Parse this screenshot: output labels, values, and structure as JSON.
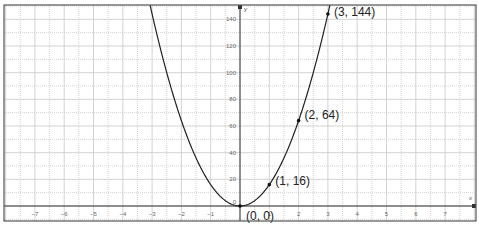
{
  "chart_data": {
    "type": "line",
    "title": "",
    "function": "y = 16x^2",
    "xlabel": "x",
    "ylabel": "y",
    "xlim": [
      -8.2,
      8.1
    ],
    "ylim": [
      -11,
      150
    ],
    "grid": true,
    "x_ticks": [
      -7,
      -6,
      -5,
      -4,
      -3,
      -2,
      -1,
      1,
      2,
      3,
      4,
      5,
      6,
      7
    ],
    "x_tick_labels": [
      "−7",
      "−6",
      "−5",
      "−4",
      "−3",
      "−2",
      "−1",
      "1",
      "2",
      "3",
      "4",
      "5",
      "6",
      "7"
    ],
    "y_ticks": [
      20,
      40,
      60,
      80,
      100,
      120,
      140
    ],
    "y_tick_labels": [
      "20",
      "40",
      "60",
      "80",
      "100",
      "120",
      "140"
    ],
    "origin_label": "0",
    "series": [
      {
        "name": "parabola",
        "color": "#222222",
        "x": [
          -3.05,
          -3,
          -2,
          -1,
          0,
          1,
          2,
          3,
          3.05
        ],
        "y": [
          148.8,
          144,
          64,
          16,
          0,
          16,
          64,
          144,
          148.8
        ]
      }
    ],
    "points": [
      {
        "x": 0,
        "y": 0,
        "label": "(0, 0)"
      },
      {
        "x": 1,
        "y": 16,
        "label": "(1, 16)"
      },
      {
        "x": 2,
        "y": 64,
        "label": "(2, 64)"
      },
      {
        "x": 3,
        "y": 144,
        "label": "(3, 144)"
      }
    ]
  },
  "layout": {
    "frame": {
      "left": 4,
      "top": 5,
      "right": 476,
      "bottom": 221
    },
    "origin_px": {
      "x": 240,
      "y": 206
    },
    "px_per_x_unit": 29.3,
    "px_per_y_unit": 1.3333,
    "colors": {
      "grid": "#c8c8c8",
      "axis": "#333333",
      "curve": "#222222",
      "frame": "#555555"
    }
  }
}
